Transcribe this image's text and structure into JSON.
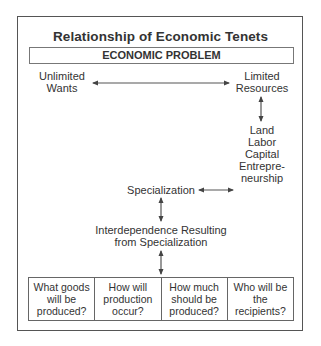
{
  "title": "Relationship of Economic Tenets",
  "problem_header": "ECONOMIC PROBLEM",
  "nodes": {
    "unlimited_wants": [
      "Unlimited",
      "Wants"
    ],
    "limited_resources": [
      "Limited",
      "Resources"
    ],
    "factors": [
      "Land",
      "Labor",
      "Capital",
      "Entrepre-",
      "neurship"
    ],
    "specialization": "Specialization",
    "interdependence": [
      "Interdependence Resulting",
      "from Specialization"
    ]
  },
  "questions": [
    [
      "What goods",
      "will be",
      "produced?"
    ],
    [
      "How will",
      "production",
      "occur?"
    ],
    [
      "How much",
      "should be",
      "produced?"
    ],
    [
      "Who will be",
      "the",
      "recipients?"
    ]
  ],
  "arrows": [
    {
      "from": "unlimited_wants",
      "to": "limited_resources",
      "type": "bidirectional"
    },
    {
      "from": "limited_resources",
      "to": "factors",
      "type": "bidirectional"
    },
    {
      "from": "specialization",
      "to": "factors",
      "type": "bidirectional"
    },
    {
      "from": "specialization",
      "to": "interdependence",
      "type": "bidirectional"
    },
    {
      "from": "interdependence",
      "to": "questions",
      "type": "bidirectional"
    }
  ],
  "colors": {
    "line": "#555555",
    "text": "#333333"
  }
}
